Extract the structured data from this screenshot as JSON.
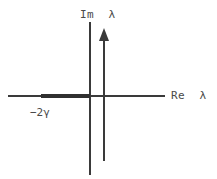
{
  "figure": {
    "kind": "complex-plane-diagram",
    "background_color": "#ffffff",
    "line_color": "#3a3a3a",
    "bold_line_color": "#303030",
    "text_color": "#4a4a4a"
  },
  "labels": {
    "imaginary_axis": "Im  λ",
    "real_axis": "Re  λ",
    "left_endpoint": "−2γ"
  },
  "chart_data": {
    "type": "diagram",
    "title": "",
    "xlabel": "Re  λ",
    "ylabel": "Im  λ",
    "origin": {
      "x": 90,
      "y": 96
    },
    "axes": [
      {
        "name": "real-axis",
        "orientation": "horizontal",
        "x1": 8,
        "y1": 96,
        "x2": 165,
        "y2": 96,
        "stroke_width": 1.2
      },
      {
        "name": "imaginary-axis",
        "orientation": "vertical",
        "x1": 90,
        "y1": 22,
        "x2": 90,
        "y2": 175,
        "stroke_width": 1.2
      }
    ],
    "annotations": [
      {
        "name": "bold-spectrum-segment",
        "type": "thick-segment",
        "x1": 41,
        "y1": 96,
        "x2": 90,
        "y2": 96,
        "stroke_width": 3.4,
        "label": "−2γ",
        "meaning": "continuous spectrum branch on negative real axis"
      },
      {
        "name": "upward-arrow",
        "type": "arrow",
        "x1": 104,
        "y1": 161,
        "x2": 104,
        "y2": 28,
        "stroke_width": 1.6,
        "head": "solid-triangle",
        "head_width": 10,
        "head_length": 13,
        "meaning": "vertical branch parallel to the imaginary axis"
      }
    ],
    "ticks": [],
    "grid": false,
    "legend": null
  }
}
